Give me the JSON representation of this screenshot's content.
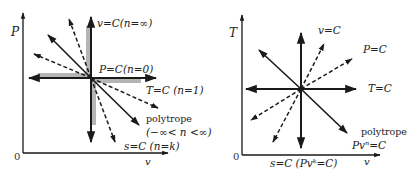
{
  "left_diagram": {
    "y_axis_label": "P",
    "x_axis_label": "v",
    "origin_label": "0",
    "labels": {
      "isochoric": "v=C(n=∞)",
      "isobaric": "P=C(n=0)",
      "isothermal": "T=C (n=1)",
      "polytrope_title": "polytrope",
      "polytrope_range": "(−∞< n <∞)",
      "isentropic": "s=C (n=k)"
    }
  },
  "right_diagram": {
    "y_axis_label": "T",
    "x_axis_label": "v",
    "origin_label": "0",
    "labels": {
      "isochoric": "v=C",
      "isobaric": "P=C",
      "isothermal": "T=C",
      "polytrope_title": "polytrope",
      "polytrope_eq": "Pvⁿ=C",
      "isentropic": "s=C (Pvᵏ=C)"
    }
  },
  "colors": {
    "line": "#1a1a1a",
    "shade": "#b5b5b5"
  }
}
